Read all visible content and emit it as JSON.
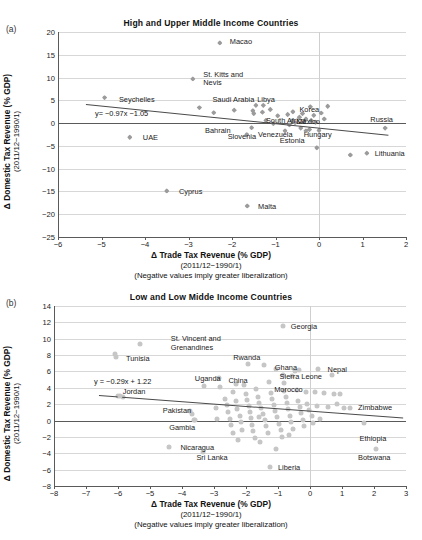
{
  "figure": {
    "panel_a_letter": "(a)",
    "panel_b_letter": "(b)"
  },
  "chart_data": [
    {
      "id": "a",
      "type": "scatter",
      "title": "High and Upper Middle Income Countries",
      "xlabel": "Δ Trade Tax Revenue (% GDP)",
      "xlabel_line2": "(2011/12−1990/1)",
      "xlabel_line3": "(Negative values imply greater liberalization)",
      "ylabel": "Δ Domestic Tax Revenue (% GDP)",
      "ylabel_line2": "(2011/12−1990/1)",
      "xlim": [
        -6,
        2
      ],
      "ylim": [
        -25,
        20
      ],
      "xticks": [
        "−6",
        "−5",
        "−4",
        "−3",
        "−2",
        "−1",
        "0",
        "1",
        "2"
      ],
      "xtick_values": [
        -6,
        -5,
        -4,
        -3,
        -2,
        -1,
        0,
        1,
        2
      ],
      "yticks": [
        "20",
        "15",
        "10",
        "5",
        "0",
        "−5",
        "−10",
        "−15",
        "−20",
        "−25"
      ],
      "ytick_values": [
        20,
        15,
        10,
        5,
        0,
        -5,
        -10,
        -15,
        -20,
        -25
      ],
      "grid": true,
      "marker": "diamond",
      "marker_color": "#9b9b9b",
      "trendline": {
        "equation": "y= −0.97x −1.05",
        "slope": -0.97,
        "intercept": -1.05,
        "x_start": -5.35,
        "x_end": 1.6,
        "label_x": -5.15,
        "label_y": 2.3
      },
      "points": [
        {
          "label": "Macao",
          "x": -2.28,
          "y": 17.6,
          "lx": -2.05,
          "ly": 18.1
        },
        {
          "label": "St. Kitts and Nevis",
          "x": -2.9,
          "y": 9.7,
          "lx": -2.66,
          "ly": 9.7
        },
        {
          "label": "Seychelles",
          "x": -4.93,
          "y": 5.6,
          "lx": -4.6,
          "ly": 5.4
        },
        {
          "label": "Saudi Arabia",
          "x": -2.75,
          "y": 3.4,
          "lx": -2.45,
          "ly": 5.3
        },
        {
          "label": "Libya",
          "x": -1.45,
          "y": 3.9,
          "lx": -1.42,
          "ly": 5.4
        },
        {
          "label": "Korea",
          "x": -0.2,
          "y": 3.6,
          "lx": -0.45,
          "ly": 3.2
        },
        {
          "label": "Russia",
          "x": 1.52,
          "y": -1.1,
          "lx": 1.18,
          "ly": 0.8
        },
        {
          "label": "South Africa",
          "x": -0.62,
          "y": 0.5,
          "lx": -1.22,
          "ly": 0.75
        },
        {
          "label": "Mexico",
          "x": -0.18,
          "y": 0.6,
          "lx": -0.52,
          "ly": 0.4
        },
        {
          "label": "UAE",
          "x": -4.35,
          "y": -3.1,
          "lx": -4.05,
          "ly": -3.1
        },
        {
          "label": "Bahrain",
          "x": -1.66,
          "y": -2.5,
          "lx": -2.62,
          "ly": -1.6
        },
        {
          "label": "Slovenia",
          "x": -1.55,
          "y": -1.0,
          "lx": -2.1,
          "ly": -2.9
        },
        {
          "label": "Venezuela",
          "x": -0.78,
          "y": -1.7,
          "lx": -1.4,
          "ly": -2.3
        },
        {
          "label": "Estonia",
          "x": -0.05,
          "y": -5.4,
          "lx": -0.9,
          "ly": -3.6
        },
        {
          "label": "Hungary",
          "x": -0.3,
          "y": -1.7,
          "lx": -0.35,
          "ly": -2.3
        },
        {
          "label": "Lithuania",
          "x": 1.1,
          "y": -6.6,
          "lx": 1.28,
          "ly": -6.6
        },
        {
          "label": "Cyprus",
          "x": -3.5,
          "y": -14.9,
          "lx": -3.22,
          "ly": -14.9
        },
        {
          "label": "Malta",
          "x": -1.65,
          "y": -18.2,
          "lx": -1.4,
          "ly": -18.2
        }
      ],
      "unlabeled_points": [
        {
          "x": -2.42,
          "y": 2.3
        },
        {
          "x": -1.95,
          "y": 2.85
        },
        {
          "x": -1.52,
          "y": 2.7
        },
        {
          "x": -1.5,
          "y": 2.1
        },
        {
          "x": -1.28,
          "y": 3.9
        },
        {
          "x": -1.3,
          "y": 2.4
        },
        {
          "x": -1.12,
          "y": 3.0
        },
        {
          "x": -0.95,
          "y": 1.6
        },
        {
          "x": -0.72,
          "y": 1.9
        },
        {
          "x": -0.6,
          "y": 2.5
        },
        {
          "x": -0.45,
          "y": 1.3
        },
        {
          "x": -0.38,
          "y": 2.1
        },
        {
          "x": -0.3,
          "y": 0.9
        },
        {
          "x": -0.12,
          "y": 1.7
        },
        {
          "x": 0.05,
          "y": 2.2
        },
        {
          "x": 0.2,
          "y": 3.7
        },
        {
          "x": 0.12,
          "y": 0.9
        },
        {
          "x": -0.08,
          "y": 0.2
        },
        {
          "x": -0.55,
          "y": 0.1
        },
        {
          "x": -0.68,
          "y": -0.4
        },
        {
          "x": -0.42,
          "y": -1.1
        },
        {
          "x": -0.22,
          "y": -1.4
        },
        {
          "x": 0.0,
          "y": -1.6
        },
        {
          "x": -1.22,
          "y": 0.6
        },
        {
          "x": -1.05,
          "y": -0.1
        },
        {
          "x": 0.72,
          "y": -7.0
        }
      ]
    },
    {
      "id": "b",
      "type": "scatter",
      "title": "Low and Low Midde Income Countries",
      "xlabel": "Δ Trade Tax Revenue (% GDP)",
      "xlabel_line2": "(2011/12−1990/1)",
      "xlabel_line3": "(Negative values imply greater liberalization)",
      "ylabel": "Δ Domestic Tax Revenue (% GDP)",
      "ylabel_line2": "(2011/12−1990/1)",
      "xlim": [
        -8,
        3
      ],
      "ylim": [
        -8,
        14
      ],
      "xticks": [
        "−8",
        "−7",
        "−6",
        "−5",
        "−4",
        "−3",
        "−2",
        "−1",
        "0",
        "1",
        "2",
        "3"
      ],
      "xtick_values": [
        -8,
        -7,
        -6,
        -5,
        -4,
        -3,
        -2,
        -1,
        0,
        1,
        2,
        3
      ],
      "yticks": [
        "14",
        "12",
        "10",
        "8",
        "6",
        "4",
        "2",
        "0",
        "−2",
        "−4",
        "−6",
        "−8"
      ],
      "ytick_values": [
        14,
        12,
        10,
        8,
        6,
        4,
        2,
        0,
        -2,
        -4,
        -6,
        -8
      ],
      "grid": true,
      "marker": "circle",
      "marker_color": "#c6c6c6",
      "trendline": {
        "equation": "y = −0.29x + 1.22",
        "slope": -0.29,
        "intercept": 1.22,
        "x_start": -6.6,
        "x_end": 2.9,
        "label_x": -6.75,
        "label_y": 4.85
      },
      "points": [
        {
          "label": "Georgia",
          "x": -0.85,
          "y": 11.6,
          "lx": -0.6,
          "ly": 11.6
        },
        {
          "label": "St. Vincent and Grenandines",
          "x": -5.3,
          "y": 9.3,
          "lx": -4.35,
          "ly": 9.45
        },
        {
          "label": "Tunisia",
          "x": -6.05,
          "y": 7.8,
          "lx": -5.75,
          "ly": 7.6
        },
        {
          "label": "Rwanda",
          "x": -1.95,
          "y": 6.9,
          "lx": -2.4,
          "ly": 7.8
        },
        {
          "label": "Ghana",
          "x": -1.05,
          "y": 6.3,
          "lx": -1.1,
          "ly": 6.5
        },
        {
          "label": "Nepal",
          "x": 0.25,
          "y": 6.3,
          "lx": 0.55,
          "ly": 6.3
        },
        {
          "label": "Uganda",
          "x": -2.85,
          "y": 5.2,
          "lx": -3.6,
          "ly": 5.2
        },
        {
          "label": "Sierra Leone",
          "x": -0.55,
          "y": 5.4,
          "lx": -0.95,
          "ly": 5.5
        },
        {
          "label": "China",
          "x": -2.3,
          "y": 4.5,
          "lx": -2.55,
          "ly": 4.9
        },
        {
          "label": "Morocco",
          "x": -0.8,
          "y": 3.6,
          "lx": -1.12,
          "ly": 3.8
        },
        {
          "label": "Jordan",
          "x": -5.95,
          "y": 2.95,
          "lx": -5.85,
          "ly": 3.65
        },
        {
          "label": "Zimbabwe",
          "x": 1.25,
          "y": 1.55,
          "lx": 1.5,
          "ly": 1.65
        },
        {
          "label": "Pakistan",
          "x": -3.75,
          "y": 1.2,
          "lx": -4.6,
          "ly": 1.25
        },
        {
          "label": "Gambia",
          "x": -3.62,
          "y": 0.05,
          "lx": -4.4,
          "ly": -0.75
        },
        {
          "label": "Ethiopia",
          "x": 1.68,
          "y": -0.3,
          "lx": 1.55,
          "ly": -2.1
        },
        {
          "label": "Nicaragua",
          "x": -4.42,
          "y": -3.2,
          "lx": -4.05,
          "ly": -3.2
        },
        {
          "label": "Sri Lanka",
          "x": -3.35,
          "y": -3.9,
          "lx": -3.55,
          "ly": -4.5
        },
        {
          "label": "Botswana",
          "x": 2.05,
          "y": -3.5,
          "lx": 1.5,
          "ly": -4.45
        },
        {
          "label": "Liberia",
          "x": -1.25,
          "y": -5.7,
          "lx": -1.0,
          "ly": -5.7
        }
      ],
      "unlabeled_points": [
        {
          "x": -6.08,
          "y": 8.15
        },
        {
          "x": -6.0,
          "y": 3.05
        },
        {
          "x": -3.7,
          "y": 0.85
        },
        {
          "x": -3.6,
          "y": 0.1
        },
        {
          "x": -2.9,
          "y": 0.15
        },
        {
          "x": -2.82,
          "y": 4.1
        },
        {
          "x": -2.65,
          "y": 2.6
        },
        {
          "x": -2.6,
          "y": 1.9
        },
        {
          "x": -2.55,
          "y": 1.1
        },
        {
          "x": -2.5,
          "y": 0.2
        },
        {
          "x": -2.48,
          "y": -0.6
        },
        {
          "x": -2.42,
          "y": -1.5
        },
        {
          "x": -2.4,
          "y": 3.5
        },
        {
          "x": -2.3,
          "y": 2.35
        },
        {
          "x": -2.28,
          "y": 1.45
        },
        {
          "x": -2.2,
          "y": 0.6
        },
        {
          "x": -2.15,
          "y": -0.2
        },
        {
          "x": -2.12,
          "y": -1.1
        },
        {
          "x": -2.05,
          "y": 4.4
        },
        {
          "x": -2.0,
          "y": 3.2
        },
        {
          "x": -1.98,
          "y": 2.5
        },
        {
          "x": -1.92,
          "y": 1.8
        },
        {
          "x": -1.88,
          "y": 1.0
        },
        {
          "x": -1.85,
          "y": 0.3
        },
        {
          "x": -1.8,
          "y": -0.5
        },
        {
          "x": -1.78,
          "y": -1.3
        },
        {
          "x": -1.72,
          "y": -2.1
        },
        {
          "x": -1.68,
          "y": 3.9
        },
        {
          "x": -1.62,
          "y": 2.9
        },
        {
          "x": -1.58,
          "y": 2.2
        },
        {
          "x": -1.52,
          "y": 1.5
        },
        {
          "x": -1.48,
          "y": 0.8
        },
        {
          "x": -1.42,
          "y": 0.1
        },
        {
          "x": -1.38,
          "y": -0.7
        },
        {
          "x": -1.32,
          "y": -1.5
        },
        {
          "x": -1.28,
          "y": 4.7
        },
        {
          "x": -1.22,
          "y": 3.4
        },
        {
          "x": -1.18,
          "y": 2.6
        },
        {
          "x": -1.12,
          "y": 1.9
        },
        {
          "x": -1.08,
          "y": 1.2
        },
        {
          "x": -1.02,
          "y": 0.4
        },
        {
          "x": -0.98,
          "y": -0.4
        },
        {
          "x": -0.92,
          "y": -1.2
        },
        {
          "x": -0.88,
          "y": -2.0
        },
        {
          "x": -0.85,
          "y": 5.6
        },
        {
          "x": -0.8,
          "y": 4.6
        },
        {
          "x": -0.75,
          "y": 2.9
        },
        {
          "x": -0.72,
          "y": 2.1
        },
        {
          "x": -0.68,
          "y": 1.4
        },
        {
          "x": -0.62,
          "y": 0.6
        },
        {
          "x": -0.58,
          "y": -0.2
        },
        {
          "x": -0.52,
          "y": -1.0
        },
        {
          "x": -0.48,
          "y": 6.1
        },
        {
          "x": -0.42,
          "y": 3.7
        },
        {
          "x": -0.38,
          "y": 2.4
        },
        {
          "x": -0.32,
          "y": 1.6
        },
        {
          "x": -0.28,
          "y": 0.9
        },
        {
          "x": -0.22,
          "y": 0.1
        },
        {
          "x": -0.18,
          "y": -0.7
        },
        {
          "x": -0.12,
          "y": 3.45
        },
        {
          "x": -0.08,
          "y": 2.0
        },
        {
          "x": -0.02,
          "y": 1.3
        },
        {
          "x": 0.05,
          "y": 0.5
        },
        {
          "x": 0.1,
          "y": -0.3
        },
        {
          "x": 0.15,
          "y": 3.5
        },
        {
          "x": 0.22,
          "y": 1.75
        },
        {
          "x": 0.3,
          "y": 0.2
        },
        {
          "x": 0.45,
          "y": 3.4
        },
        {
          "x": 0.55,
          "y": 1.6
        },
        {
          "x": 0.68,
          "y": 5.6
        },
        {
          "x": 0.75,
          "y": 3.3
        },
        {
          "x": 0.85,
          "y": 2.0
        },
        {
          "x": 0.95,
          "y": 3.25
        },
        {
          "x": 1.05,
          "y": 1.5
        },
        {
          "x": -3.3,
          "y": 4.2
        },
        {
          "x": -2.95,
          "y": 1.55
        },
        {
          "x": -1.55,
          "y": -2.6
        },
        {
          "x": -1.05,
          "y": -3.5
        },
        {
          "x": -0.65,
          "y": -1.75
        },
        {
          "x": -2.25,
          "y": -2.4
        },
        {
          "x": -5.85,
          "y": 2.85
        },
        {
          "x": -0.35,
          "y": 6.2
        },
        {
          "x": -1.45,
          "y": 6.85
        },
        {
          "x": -1.6,
          "y": 0.45
        }
      ]
    }
  ]
}
